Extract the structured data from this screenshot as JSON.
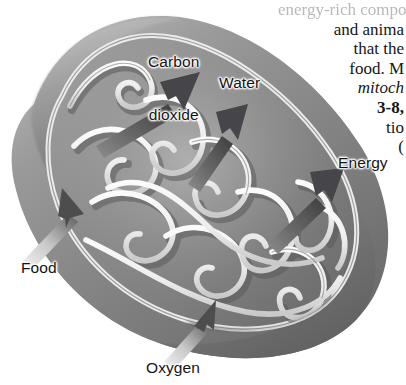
{
  "figure": {
    "name": "mitochondrion-cross-section",
    "style": "grayscale textbook airbrush illustration",
    "palette": {
      "background": "#ffffff",
      "outer_membrane_dark": "#6f6f6f",
      "outer_membrane_mid": "#8c8c8c",
      "outer_membrane_light": "#b2b2b2",
      "matrix_dark": "#737373",
      "matrix_mid": "#949494",
      "matrix_light": "#bdbdbd",
      "cristae_highlight": "#f2f2f2",
      "cristae_shadow": "#5d5d5d",
      "arrow_dark": "#4a4a4a",
      "arrow_light": "#e3e3e3",
      "text": "#131313"
    }
  },
  "labels": {
    "carbon_dioxide": "Carbon\ndioxide",
    "carbon_dioxide_line1": "Carbon",
    "carbon_dioxide_line2": "dioxide",
    "water": "Water",
    "energy": "Energy",
    "food": "Food",
    "oxygen": "Oxygen"
  },
  "arrows": [
    {
      "label": "Carbon dioxide",
      "direction": "outward",
      "tone": "dark",
      "origin": "inner matrix (upper left)",
      "points_to": "upper right"
    },
    {
      "label": "Water",
      "direction": "outward",
      "tone": "dark",
      "origin": "inner matrix (center)",
      "points_to": "upper right"
    },
    {
      "label": "Energy",
      "direction": "outward",
      "tone": "dark",
      "origin": "inner matrix (right)",
      "points_to": "upper right"
    },
    {
      "label": "Food",
      "direction": "inward",
      "tone": "light",
      "origin": "outside lower left",
      "points_to": "inner matrix"
    },
    {
      "label": "Oxygen",
      "direction": "inward",
      "tone": "light",
      "origin": "outside bottom",
      "points_to": "inner matrix"
    }
  ],
  "body_text": {
    "lines": [
      {
        "text": "energy-rich compounds",
        "style": "clipped",
        "clipped": true
      },
      {
        "text": "and anima",
        "style": "roman",
        "clipped": true
      },
      {
        "text": "that the",
        "style": "roman",
        "clipped": true
      },
      {
        "text": "food. M",
        "style": "roman",
        "clipped": true
      },
      {
        "text": "mitoch",
        "style": "italic",
        "clipped": true
      },
      {
        "text": "3-8,",
        "style": "bold",
        "clipped": true
      },
      {
        "text": "tio",
        "style": "roman",
        "clipped": true
      },
      {
        "text": "(",
        "style": "roman",
        "clipped": true
      }
    ]
  }
}
